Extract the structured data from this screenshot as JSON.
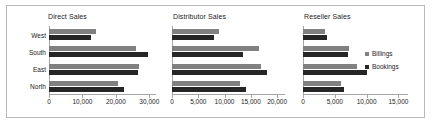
{
  "chart_data": {
    "type": "bar",
    "orientation": "horizontal",
    "title": "",
    "categories": [
      "West",
      "South",
      "East",
      "North"
    ],
    "legend": {
      "position": "right",
      "entries": [
        {
          "name": "Billings",
          "color": "#808080"
        },
        {
          "name": "Bookings",
          "color": "#262626"
        }
      ]
    },
    "panels": [
      {
        "title": "Direct Sales",
        "xlabel": "",
        "ylabel": "",
        "xlim": [
          0,
          32000
        ],
        "xticks": [
          0,
          10000,
          20000,
          30000
        ],
        "xticklabels": [
          "0",
          "10,000",
          "20,000",
          "30,000"
        ],
        "grid": false,
        "series": [
          {
            "name": "Billings",
            "values": [
              14000,
              26000,
              27000,
              20500
            ]
          },
          {
            "name": "Bookings",
            "values": [
              12500,
              29500,
              26500,
              22500
            ]
          }
        ]
      },
      {
        "title": "Distributor Sales",
        "xlabel": "",
        "ylabel": "",
        "xlim": [
          0,
          21500
        ],
        "xticks": [
          0,
          5000,
          10000,
          15000,
          20000
        ],
        "xticklabels": [
          "0",
          "5,000",
          "10,000",
          "15,000",
          "20,000"
        ],
        "grid": false,
        "series": [
          {
            "name": "Billings",
            "values": [
              9000,
              16500,
              17000,
              13000
            ]
          },
          {
            "name": "Bookings",
            "values": [
              8000,
              13500,
              18000,
              14000
            ]
          }
        ]
      },
      {
        "title": "Reseller Sales",
        "xlabel": "",
        "ylabel": "",
        "xlim": [
          0,
          16500
        ],
        "xticks": [
          0,
          5000,
          10000,
          15000
        ],
        "xticklabels": [
          "0",
          "5,000",
          "10,000",
          "15,000"
        ],
        "grid": false,
        "series": [
          {
            "name": "Billings",
            "values": [
              3500,
              7200,
              8500,
              6000
            ]
          },
          {
            "name": "Bookings",
            "values": [
              3700,
              7000,
              10000,
              6500
            ]
          }
        ]
      }
    ]
  }
}
